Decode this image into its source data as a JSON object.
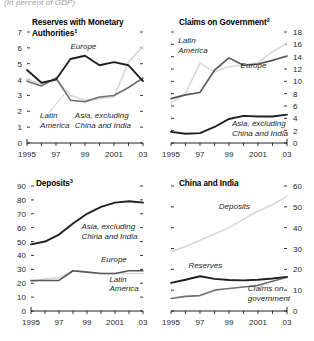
{
  "header": {
    "units": "(In percent of GDP)"
  },
  "chart_data": [
    {
      "type": "line",
      "title": "Reserves with Monetary Authorities",
      "title_superscript": "1",
      "panel": "top-left",
      "xlabel": "",
      "ylabel": "",
      "x": [
        1995,
        1996,
        1997,
        1998,
        1999,
        2000,
        2001,
        2002,
        2003
      ],
      "xticks": [
        1995,
        1997,
        1999,
        2001,
        2003
      ],
      "xticklabels": [
        "1995",
        "97",
        "99",
        "2001",
        "03"
      ],
      "xlim": [
        1995,
        2003
      ],
      "ylim": [
        0,
        7
      ],
      "yticks": [
        0,
        1,
        2,
        3,
        4,
        5,
        6,
        7
      ],
      "yticklabels": [
        "0",
        "1",
        "2",
        "3",
        "4",
        "5",
        "6",
        "7"
      ],
      "yaxis_side": "left",
      "grid": false,
      "legend": "inline-annotations",
      "series": [
        {
          "name": "Europe",
          "color": "#231f20",
          "values": [
            4.6,
            3.8,
            4.0,
            5.3,
            5.5,
            4.9,
            5.1,
            4.9,
            3.9
          ],
          "label_x": 1998.0,
          "label_y": 5.95
        },
        {
          "name": "Latin America",
          "color": "#d8d8d8",
          "values": [
            4.0,
            3.7,
            4.0,
            3.0,
            2.7,
            2.8,
            2.9,
            5.1,
            6.1
          ],
          "label_x": 1995.9,
          "label_y": 1.55
        },
        {
          "name": "Asia, excluding China and India",
          "color": "#6f6f6f",
          "values": [
            3.9,
            3.6,
            4.1,
            2.7,
            2.6,
            2.9,
            3.0,
            3.5,
            4.1
          ],
          "label_x": 1998.3,
          "label_y": 1.55
        }
      ]
    },
    {
      "type": "line",
      "title": "Claims on Government",
      "title_superscript": "2",
      "panel": "top-right",
      "xlabel": "",
      "ylabel": "",
      "x": [
        1995,
        1996,
        1997,
        1998,
        1999,
        2000,
        2001,
        2002,
        2003
      ],
      "xticks": [
        1995,
        1997,
        1999,
        2001,
        2003
      ],
      "xticklabels": [
        "1995",
        "97",
        "99",
        "2001",
        "03"
      ],
      "xlim": [
        1995,
        2003
      ],
      "ylim": [
        0,
        18
      ],
      "yticks": [
        0,
        2,
        4,
        6,
        8,
        10,
        12,
        14,
        16,
        18
      ],
      "yticklabels": [
        "0",
        "2",
        "4",
        "6",
        "8",
        "10",
        "12",
        "14",
        "16",
        "18"
      ],
      "yaxis_side": "right",
      "grid": false,
      "legend": "inline-annotations",
      "series": [
        {
          "name": "Latin America",
          "color": "#d8d8d8",
          "values": [
            6.5,
            8.0,
            13.0,
            11.5,
            12.4,
            12.6,
            13.0,
            14.8,
            16.2
          ],
          "label_x": 1995.5,
          "label_y": 16.2
        },
        {
          "name": "Europe",
          "color": "#555555",
          "values": [
            7.2,
            7.8,
            8.2,
            11.8,
            13.8,
            12.6,
            12.8,
            13.4,
            14.1
          ],
          "label_x": 1999.8,
          "label_y": 12.1
        },
        {
          "name": "Asia, excluding China and India",
          "color": "#231f20",
          "values": [
            1.8,
            1.5,
            1.6,
            2.6,
            3.9,
            4.4,
            4.3,
            4.3,
            4.6
          ],
          "label_x": 1999.2,
          "label_y": 2.7
        }
      ]
    },
    {
      "type": "line",
      "title": "Deposits",
      "title_superscript": "3",
      "panel": "bottom-left",
      "xlabel": "",
      "ylabel": "",
      "x": [
        1995,
        1996,
        1997,
        1998,
        1999,
        2000,
        2001,
        2002,
        2003
      ],
      "xticks": [
        1995,
        1997,
        1999,
        2001,
        2003
      ],
      "xticklabels": [
        "1995",
        "97",
        "99",
        "2001",
        "03"
      ],
      "xlim": [
        1995,
        2003
      ],
      "ylim": [
        0,
        90
      ],
      "yticks": [
        0,
        10,
        20,
        30,
        40,
        50,
        60,
        70,
        80,
        90
      ],
      "yticklabels": [
        "0",
        "10",
        "20",
        "30",
        "40",
        "50",
        "60",
        "70",
        "80",
        "90"
      ],
      "yaxis_side": "left",
      "grid": false,
      "legend": "inline-annotations",
      "series": [
        {
          "name": "Asia, excluding China and India",
          "color": "#231f20",
          "values": [
            48,
            50,
            55,
            63,
            70,
            75,
            78,
            79,
            78
          ],
          "label_x": 1998.6,
          "label_y": 59
        },
        {
          "name": "Europe",
          "color": "#555555",
          "values": [
            22,
            22,
            22,
            29,
            28,
            27,
            27,
            29,
            29
          ],
          "label_x": 2000.0,
          "label_y": 35
        },
        {
          "name": "Latin America",
          "color": "#d8d8d8",
          "values": [
            21,
            23,
            24,
            29,
            28,
            27,
            27,
            27,
            27
          ],
          "label_x": 2000.6,
          "label_y": 21
        }
      ]
    },
    {
      "type": "line",
      "title": "China and India",
      "title_superscript": "",
      "panel": "bottom-right",
      "xlabel": "",
      "ylabel": "",
      "x": [
        1995,
        1996,
        1997,
        1998,
        1999,
        2000,
        2001,
        2002,
        2003
      ],
      "xticks": [
        1995,
        1997,
        1999,
        2001,
        2003
      ],
      "xticklabels": [
        "1995",
        "97",
        "99",
        "2001",
        "03"
      ],
      "xlim": [
        1995,
        2003
      ],
      "ylim": [
        0,
        60
      ],
      "yticks": [
        0,
        10,
        20,
        30,
        40,
        50,
        60
      ],
      "yticklabels": [
        "0",
        "10",
        "20",
        "30",
        "40",
        "50",
        "60"
      ],
      "yaxis_side": "right",
      "grid": false,
      "legend": "inline-annotations",
      "series": [
        {
          "name": "Deposits",
          "color": "#d8d8d8",
          "values": [
            28.5,
            31,
            34,
            37,
            40,
            44,
            48,
            51,
            55
          ],
          "label_x": 1998.3,
          "label_y": 49
        },
        {
          "name": "Reserves",
          "color": "#231f20",
          "values": [
            13.5,
            15.0,
            16.7,
            15.4,
            14.9,
            14.7,
            15.0,
            15.6,
            16.4
          ],
          "label_x": 1996.2,
          "label_y": 20.5
        },
        {
          "name": "Claims on government",
          "color": "#6f6f6f",
          "values": [
            6.0,
            7.0,
            7.4,
            10.0,
            10.8,
            11.5,
            12.3,
            14.3,
            16.2
          ],
          "label_x": 2000.3,
          "label_y": 9.6
        }
      ]
    }
  ]
}
